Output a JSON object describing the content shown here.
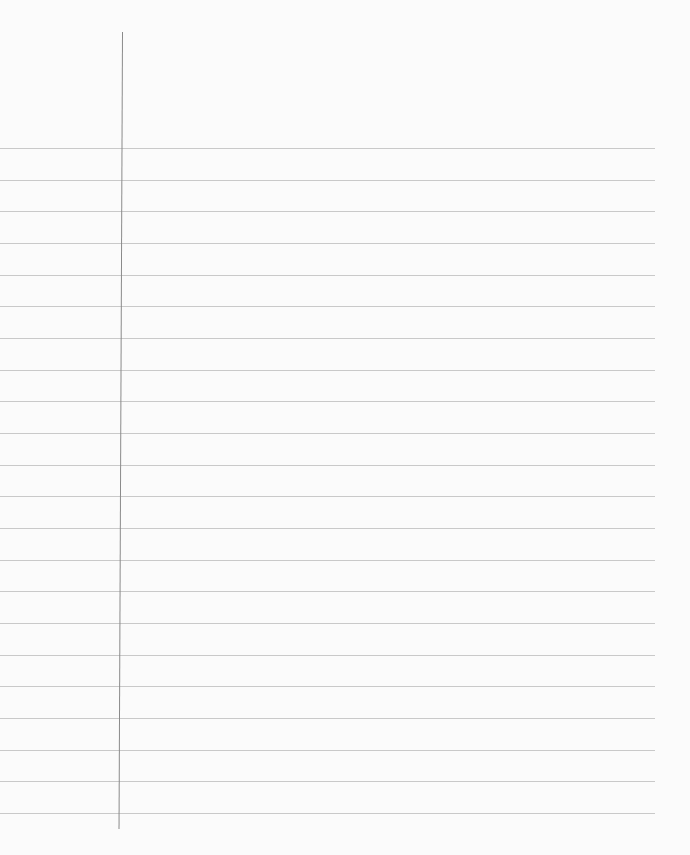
{
  "paper": {
    "type": "lined-notebook-paper",
    "background_color": "#fbfbfb",
    "rule_color": "#c9c9c9",
    "margin_color": "#8a8a8a",
    "rule_count": 22,
    "first_rule_y": 148,
    "rule_spacing": 31.67,
    "rule_end_x": 655,
    "margin_x": 122,
    "margin_top": 32,
    "margin_bottom": 829
  }
}
